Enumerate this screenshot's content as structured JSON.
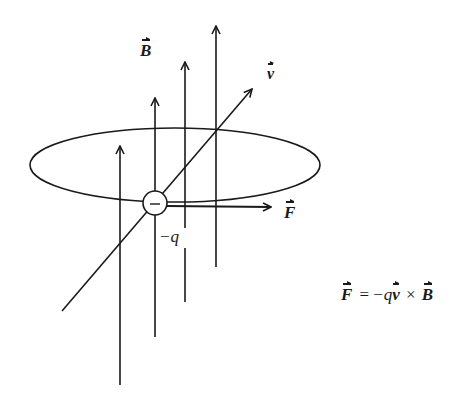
{
  "diagram": {
    "labels": {
      "B_field": "B",
      "velocity": "v",
      "force": "F",
      "charge": "−q",
      "charge_sign": "−"
    },
    "equation": {
      "lhs": "F",
      "equals": "=",
      "minus_q": "−q",
      "v": "v",
      "cross": "×",
      "B": "B"
    },
    "colors": {
      "stroke": "#1a1a1a",
      "background": "#ffffff"
    }
  }
}
